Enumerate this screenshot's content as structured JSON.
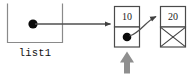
{
  "diagram": {
    "variable_box": {
      "label": "list1",
      "pointer_symbol": "filled-dot"
    },
    "nodes": [
      {
        "id": "node-1",
        "value": "10",
        "next_cell": "filled-dot"
      },
      {
        "id": "node-2",
        "value": "20",
        "next_cell": "null-slash-x"
      }
    ],
    "annotations": {
      "highlight_arrow": "up-arrow"
    },
    "colors": {
      "line": "#555555",
      "box_border": "#7a7a7a",
      "node_border": "#4a4a4a",
      "dot": "#000000",
      "text": "#1c1c1c",
      "highlight_arrow": "#8c8c8c",
      "background": "#ffffff"
    }
  }
}
